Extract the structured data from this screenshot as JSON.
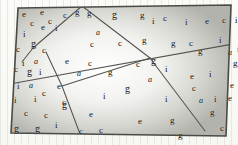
{
  "figure": {
    "name": "letter-scatter-quadrilateral",
    "colors": {
      "ink": "#14100c",
      "border": "#4a4a46",
      "divider": "#55534e",
      "fill_center": "#ffffff",
      "fill_edge": "#b9b9b4",
      "page": "#fbfbf8",
      "rule": "#bec3b9"
    },
    "outline": [
      [
        18,
        8
      ],
      [
        231,
        5
      ],
      [
        226,
        136
      ],
      [
        11,
        133
      ]
    ],
    "dividers": [
      {
        "name": "divider-top-left-branch",
        "from": [
          82,
          6
        ],
        "to": [
          33,
          48
        ]
      },
      {
        "name": "divider-left-lower",
        "from": [
          33,
          48
        ],
        "to": [
          22,
          62
        ]
      },
      {
        "name": "divider-left-steep",
        "from": [
          46,
          52
        ],
        "to": [
          62,
          86
        ]
      },
      {
        "name": "divider-left-to-bottom",
        "from": [
          62,
          86
        ],
        "to": [
          80,
          134
        ]
      },
      {
        "name": "divider-top-right-branch",
        "from": [
          82,
          6
        ],
        "to": [
          150,
          58
        ]
      },
      {
        "name": "divider-center-crossing",
        "from": [
          150,
          58
        ],
        "to": [
          205,
          131
        ]
      },
      {
        "name": "divider-long-diagonal",
        "from": [
          10,
          84
        ],
        "to": [
          233,
          44
        ]
      },
      {
        "name": "divider-center-to-bottom-left",
        "from": [
          62,
          86
        ],
        "to": [
          150,
          58
        ]
      }
    ],
    "letters": [
      {
        "char": "e",
        "x": 22,
        "y": 10,
        "size": 9,
        "italic": false
      },
      {
        "char": "e",
        "x": 40,
        "y": 8,
        "size": 9,
        "italic": false
      },
      {
        "char": "c",
        "x": 63,
        "y": 11,
        "size": 9,
        "italic": false
      },
      {
        "char": "g",
        "x": 75,
        "y": 8,
        "size": 9,
        "italic": false
      },
      {
        "char": "g",
        "x": 87,
        "y": 9,
        "size": 9,
        "italic": false
      },
      {
        "char": "c",
        "x": 30,
        "y": 19,
        "size": 9,
        "italic": false
      },
      {
        "char": "c",
        "x": 48,
        "y": 17,
        "size": 9,
        "italic": false
      },
      {
        "char": "g",
        "x": 112,
        "y": 10,
        "size": 10,
        "italic": false
      },
      {
        "char": "g",
        "x": 140,
        "y": 11,
        "size": 9,
        "italic": false
      },
      {
        "char": "c",
        "x": 163,
        "y": 14,
        "size": 9,
        "italic": false
      },
      {
        "char": "i",
        "x": 152,
        "y": 17,
        "size": 9,
        "italic": false
      },
      {
        "char": "i",
        "x": 185,
        "y": 18,
        "size": 9,
        "italic": false
      },
      {
        "char": "e",
        "x": 205,
        "y": 17,
        "size": 9,
        "italic": false
      },
      {
        "char": "c",
        "x": 222,
        "y": 16,
        "size": 9,
        "italic": false
      },
      {
        "char": "i",
        "x": 235,
        "y": 16,
        "size": 9,
        "italic": false
      },
      {
        "char": "e",
        "x": 41,
        "y": 23,
        "size": 9,
        "italic": false
      },
      {
        "char": "i",
        "x": 55,
        "y": 24,
        "size": 9,
        "italic": false
      },
      {
        "char": "i",
        "x": 23,
        "y": 30,
        "size": 9,
        "italic": false
      },
      {
        "char": "a",
        "x": 96,
        "y": 29,
        "size": 8,
        "italic": true
      },
      {
        "char": "c",
        "x": 90,
        "y": 40,
        "size": 9,
        "italic": false
      },
      {
        "char": "c",
        "x": 118,
        "y": 39,
        "size": 9,
        "italic": false
      },
      {
        "char": "g",
        "x": 142,
        "y": 36,
        "size": 9,
        "italic": false
      },
      {
        "char": "g",
        "x": 171,
        "y": 39,
        "size": 9,
        "italic": false
      },
      {
        "char": "c",
        "x": 189,
        "y": 39,
        "size": 9,
        "italic": false
      },
      {
        "char": "i",
        "x": 219,
        "y": 36,
        "size": 9,
        "italic": false
      },
      {
        "char": "g",
        "x": 31,
        "y": 39,
        "size": 10,
        "italic": false
      },
      {
        "char": "c",
        "x": 16,
        "y": 45,
        "size": 9,
        "italic": false
      },
      {
        "char": "c",
        "x": 42,
        "y": 46,
        "size": 9,
        "italic": false
      },
      {
        "char": "g",
        "x": 198,
        "y": 47,
        "size": 9,
        "italic": false
      },
      {
        "char": "a",
        "x": 228,
        "y": 49,
        "size": 8,
        "italic": true
      },
      {
        "char": "i",
        "x": 237,
        "y": 45,
        "size": 9,
        "italic": false
      },
      {
        "char": "i",
        "x": 22,
        "y": 59,
        "size": 9,
        "italic": false
      },
      {
        "char": "a",
        "x": 34,
        "y": 58,
        "size": 8,
        "italic": true
      },
      {
        "char": "e",
        "x": 65,
        "y": 57,
        "size": 9,
        "italic": false
      },
      {
        "char": "c",
        "x": 88,
        "y": 59,
        "size": 9,
        "italic": false
      },
      {
        "char": "c",
        "x": 14,
        "y": 65,
        "size": 9,
        "italic": false
      },
      {
        "char": "g",
        "x": 27,
        "y": 67,
        "size": 10,
        "italic": false
      },
      {
        "char": "i",
        "x": 39,
        "y": 68,
        "size": 9,
        "italic": false
      },
      {
        "char": "a",
        "x": 77,
        "y": 70,
        "size": 8,
        "italic": true
      },
      {
        "char": "g",
        "x": 108,
        "y": 68,
        "size": 9,
        "italic": false
      },
      {
        "char": "c",
        "x": 136,
        "y": 60,
        "size": 9,
        "italic": false
      },
      {
        "char": "g",
        "x": 151,
        "y": 56,
        "size": 10,
        "italic": false
      },
      {
        "char": "i",
        "x": 165,
        "y": 65,
        "size": 9,
        "italic": false
      },
      {
        "char": "e",
        "x": 190,
        "y": 72,
        "size": 9,
        "italic": false
      },
      {
        "char": "i",
        "x": 209,
        "y": 70,
        "size": 9,
        "italic": false
      },
      {
        "char": "g",
        "x": 233,
        "y": 59,
        "size": 9,
        "italic": false
      },
      {
        "char": "a",
        "x": 148,
        "y": 76,
        "size": 8,
        "italic": true
      },
      {
        "char": "i",
        "x": 17,
        "y": 82,
        "size": 9,
        "italic": false
      },
      {
        "char": "a",
        "x": 29,
        "y": 82,
        "size": 8,
        "italic": true
      },
      {
        "char": "e",
        "x": 57,
        "y": 82,
        "size": 9,
        "italic": false
      },
      {
        "char": "c",
        "x": 42,
        "y": 89,
        "size": 9,
        "italic": false
      },
      {
        "char": "g",
        "x": 125,
        "y": 84,
        "size": 10,
        "italic": false
      },
      {
        "char": "c",
        "x": 192,
        "y": 84,
        "size": 9,
        "italic": false
      },
      {
        "char": "e",
        "x": 230,
        "y": 81,
        "size": 9,
        "italic": false
      },
      {
        "char": "i",
        "x": 14,
        "y": 96,
        "size": 9,
        "italic": false
      },
      {
        "char": "i",
        "x": 34,
        "y": 95,
        "size": 9,
        "italic": false
      },
      {
        "char": "c",
        "x": 62,
        "y": 98,
        "size": 9,
        "italic": false
      },
      {
        "char": "i",
        "x": 103,
        "y": 92,
        "size": 9,
        "italic": false
      },
      {
        "char": "i",
        "x": 165,
        "y": 95,
        "size": 9,
        "italic": false
      },
      {
        "char": "a",
        "x": 199,
        "y": 97,
        "size": 8,
        "italic": true
      },
      {
        "char": "i",
        "x": 214,
        "y": 95,
        "size": 9,
        "italic": false
      },
      {
        "char": "e",
        "x": 228,
        "y": 94,
        "size": 9,
        "italic": false
      },
      {
        "char": "g",
        "x": 62,
        "y": 100,
        "size": 10,
        "italic": false
      },
      {
        "char": "c",
        "x": 24,
        "y": 109,
        "size": 9,
        "italic": false
      },
      {
        "char": "c",
        "x": 44,
        "y": 111,
        "size": 9,
        "italic": false
      },
      {
        "char": "e",
        "x": 89,
        "y": 110,
        "size": 9,
        "italic": false
      },
      {
        "char": "g",
        "x": 210,
        "y": 108,
        "size": 9,
        "italic": false
      },
      {
        "char": "e",
        "x": 138,
        "y": 117,
        "size": 9,
        "italic": false
      },
      {
        "char": "g",
        "x": 170,
        "y": 116,
        "size": 9,
        "italic": false
      },
      {
        "char": "i",
        "x": 55,
        "y": 121,
        "size": 9,
        "italic": false
      },
      {
        "char": "g",
        "x": 14,
        "y": 124,
        "size": 10,
        "italic": false
      },
      {
        "char": "g",
        "x": 35,
        "y": 124,
        "size": 10,
        "italic": false
      },
      {
        "char": "c",
        "x": 79,
        "y": 127,
        "size": 9,
        "italic": false
      },
      {
        "char": "c",
        "x": 99,
        "y": 126,
        "size": 9,
        "italic": false
      },
      {
        "char": "g",
        "x": 178,
        "y": 131,
        "size": 9,
        "italic": false
      },
      {
        "char": "c",
        "x": 220,
        "y": 124,
        "size": 9,
        "italic": false
      }
    ]
  }
}
